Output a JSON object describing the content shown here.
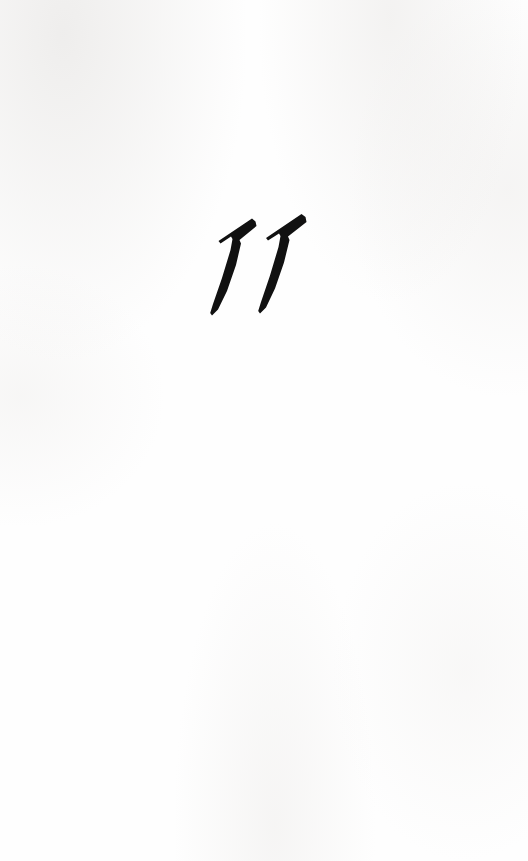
{
  "page": {
    "background_color": "#fefefe",
    "ink_color": "#111111",
    "width": 528,
    "height": 861
  },
  "chapter_opening": {
    "number_text": "11",
    "digits": [
      {
        "glyph": "1",
        "name": "numeral-one-first"
      },
      {
        "glyph": "1",
        "name": "numeral-one-second"
      }
    ],
    "style_note": "bold italic calligraphic serif"
  }
}
